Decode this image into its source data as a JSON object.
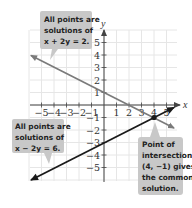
{
  "chart_data": {
    "type": "line",
    "title": "",
    "xlabel": "x",
    "ylabel": "y",
    "xlim": [
      -5,
      5
    ],
    "ylim": [
      -5,
      5
    ],
    "grid": true,
    "x_tick_labels": [
      "-5",
      "-4",
      "-3",
      "-2",
      "-1",
      "1",
      "2",
      "3",
      "4",
      "5"
    ],
    "y_tick_labels": [
      "5",
      "4",
      "3",
      "2",
      "1",
      "-1",
      "-2",
      "-3",
      "-4",
      "-5"
    ],
    "series": [
      {
        "name": "x + 2y = 2",
        "color": "#7a7a7a",
        "points": [
          [
            -6,
            4
          ],
          [
            5.7,
            -1.85
          ]
        ]
      },
      {
        "name": "x - 2y = 6",
        "color": "#1a1a1a",
        "points": [
          [
            -6,
            -6
          ],
          [
            5.7,
            -0.15
          ]
        ]
      }
    ],
    "highlight_point": {
      "x": 4,
      "y": -1,
      "label": "(4, -1)"
    },
    "annotations": [
      {
        "lines": [
          "All points are",
          "solutions of",
          "x + 2y = 2."
        ]
      },
      {
        "lines": [
          "All points are",
          "solutions of",
          "x − 2y = 6."
        ]
      },
      {
        "lines": [
          "Point of",
          "intersection",
          "(4, −1) gives",
          "the common",
          "solution."
        ]
      }
    ]
  },
  "colors": {
    "grid": "#e6e6e6",
    "axis": "#444444",
    "line1": "#7a7a7a",
    "line2": "#1a1a1a",
    "callout_bg": "#c8c8c8"
  }
}
